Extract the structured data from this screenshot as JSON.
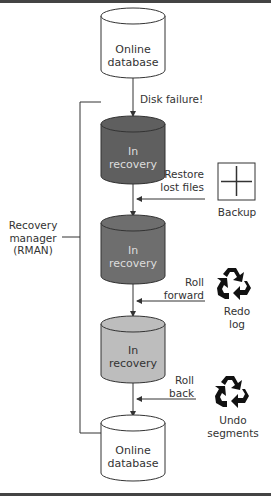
{
  "diagram": {
    "type": "flowchart",
    "nodes": {
      "top_db": {
        "label_line1": "Online",
        "label_line2": "database",
        "fill": "#ffffff"
      },
      "rec1": {
        "label_line1": "In",
        "label_line2": "recovery",
        "fill": "#5f5f5f"
      },
      "rec2": {
        "label_line1": "In",
        "label_line2": "recovery",
        "fill": "#6e6e6e"
      },
      "rec3": {
        "label_line1": "In",
        "label_line2": "recovery",
        "fill": "#bdbdbd"
      },
      "bottom_db": {
        "label_line1": "Online",
        "label_line2": "database",
        "fill": "#ffffff"
      }
    },
    "edges": {
      "disk_failure": "Disk failure!",
      "restore_line1": "Restore",
      "restore_line2": "lost files",
      "roll_forward_line1": "Roll",
      "roll_forward_line2": "forward",
      "roll_back_line1": "Roll",
      "roll_back_line2": "back"
    },
    "sources": {
      "backup": {
        "label": "Backup",
        "icon": "plus-box-icon"
      },
      "redo": {
        "label_line1": "Redo",
        "label_line2": "log",
        "icon": "recycle-icon"
      },
      "undo": {
        "label_line1": "Undo",
        "label_line2": "segments",
        "icon": "recycle-icon"
      }
    },
    "bracket": {
      "label_line1": "Recovery",
      "label_line2": "manager",
      "label_line3": "(RMAN)"
    }
  }
}
